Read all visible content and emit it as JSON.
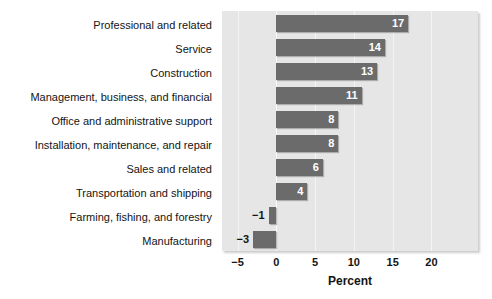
{
  "chart_data": {
    "type": "bar",
    "orientation": "horizontal",
    "title": "",
    "xlabel": "Percent",
    "ylabel": "",
    "categories": [
      "Professional and related",
      "Service",
      "Construction",
      "Management, business, and financial",
      "Office and administrative support",
      "Installation, maintenance, and repair",
      "Sales and related",
      "Transportation and shipping",
      "Farming, fishing, and forestry",
      "Manufacturing"
    ],
    "values": [
      17,
      14,
      13,
      11,
      8,
      8,
      6,
      4,
      -1,
      -3
    ],
    "value_labels": [
      "17",
      "14",
      "13",
      "11",
      "8",
      "8",
      "6",
      "4",
      "−1",
      "−3"
    ],
    "xlim": [
      -7,
      26
    ],
    "xticks": [
      -5,
      0,
      5,
      10,
      15,
      20
    ],
    "xtick_labels": [
      "−5",
      "0",
      "5",
      "10",
      "15",
      "20"
    ],
    "grid": true,
    "legend": "none",
    "colors": {
      "bar": "#6b6b6b",
      "plot_background": "#e6e6e6",
      "gridline": "#f4f4f4",
      "page_background": "#ffffff",
      "text": "#141414",
      "value_label_inside": "#ffffff"
    }
  }
}
